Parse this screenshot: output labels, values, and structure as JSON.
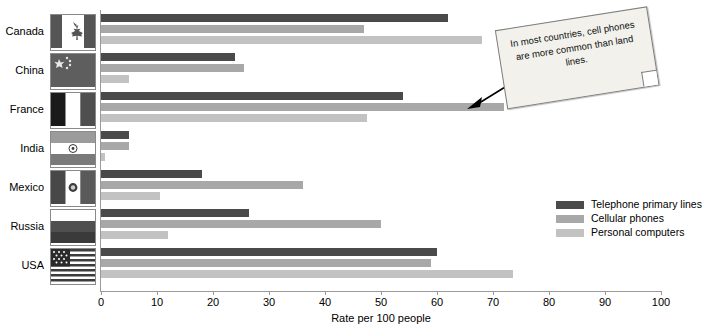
{
  "chart_data": {
    "type": "bar",
    "orientation": "horizontal",
    "title": "",
    "xlabel": "Rate per 100 people",
    "ylabel": "",
    "xlim": [
      0,
      100
    ],
    "xticks": [
      0,
      10,
      20,
      30,
      40,
      50,
      60,
      70,
      80,
      90,
      100
    ],
    "grid": false,
    "legend_position": "right",
    "categories": [
      "Canada",
      "China",
      "France",
      "India",
      "Mexico",
      "Russia",
      "USA"
    ],
    "series": [
      {
        "name": "Telephone primary lines",
        "color": "#4a4a4a",
        "values": [
          62,
          24,
          54,
          5,
          18,
          26.5,
          60
        ]
      },
      {
        "name": "Cellular phones",
        "color": "#a8a8a8",
        "values": [
          47,
          25.5,
          72,
          5,
          36,
          50,
          59
        ]
      },
      {
        "name": "Personal computers",
        "color": "#c2c2c2",
        "values": [
          68,
          5,
          47.5,
          0.7,
          10.5,
          12,
          73.5
        ]
      }
    ],
    "annotations": [
      {
        "text": "In most countries, cell phones are more common than land lines.",
        "type": "callout-note"
      }
    ]
  },
  "axis": {
    "xlabel": "Rate per 100 people",
    "ticklabels": [
      "0",
      "10",
      "20",
      "30",
      "40",
      "50",
      "60",
      "70",
      "80",
      "90",
      "100"
    ]
  },
  "legend": {
    "items": [
      {
        "label": "Telephone primary lines",
        "color": "#4a4a4a"
      },
      {
        "label": "Cellular phones",
        "color": "#a8a8a8"
      },
      {
        "label": "Personal computers",
        "color": "#c2c2c2"
      }
    ]
  },
  "rows": [
    {
      "country": "Canada",
      "flag": "flag-canada"
    },
    {
      "country": "China",
      "flag": "flag-china"
    },
    {
      "country": "France",
      "flag": "flag-france"
    },
    {
      "country": "India",
      "flag": "flag-india"
    },
    {
      "country": "Mexico",
      "flag": "flag-mexico"
    },
    {
      "country": "Russia",
      "flag": "flag-russia"
    },
    {
      "country": "USA",
      "flag": "flag-usa"
    }
  ],
  "note": {
    "text": "In most countries, cell phones are more common than land lines."
  }
}
